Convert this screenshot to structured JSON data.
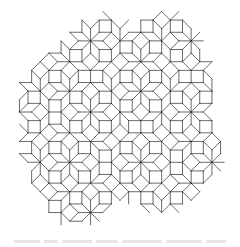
{
  "figure": {
    "tile_types": [
      "square",
      "rhombus-45deg"
    ],
    "line_color": "#2a2a2a",
    "background_color": "#ffffff",
    "symmetry": "8-fold"
  },
  "caption": {
    "text": "",
    "legible": false,
    "color": "#e6e6e6"
  }
}
